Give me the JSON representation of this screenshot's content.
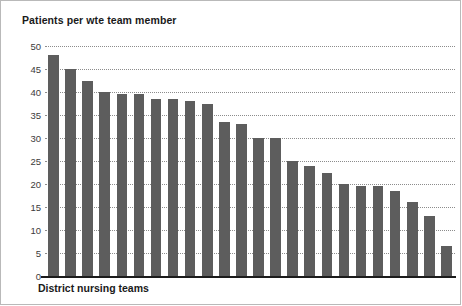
{
  "chart_data": {
    "type": "bar",
    "title": "Patients per wte team member",
    "xlabel": "District nursing teams",
    "ylabel": "",
    "ylim": [
      0,
      50
    ],
    "ytick_step": 5,
    "yticks": [
      50,
      45,
      40,
      35,
      30,
      25,
      20,
      15,
      10,
      5,
      0
    ],
    "grid": true,
    "grid_style": "dotted-horizontal",
    "legend": "none",
    "bar_color": "#5d5d5d",
    "categories": [
      "Team 1",
      "Team 2",
      "Team 3",
      "Team 4",
      "Team 5",
      "Team 6",
      "Team 7",
      "Team 8",
      "Team 9",
      "Team 10",
      "Team 11",
      "Team 12",
      "Team 13",
      "Team 14",
      "Team 15",
      "Team 16",
      "Team 17",
      "Team 18",
      "Team 19",
      "Team 20",
      "Team 21",
      "Team 22",
      "Team 23",
      "Team 24"
    ],
    "values": [
      48,
      45,
      42.5,
      40,
      39.5,
      39.5,
      38.5,
      38.5,
      38,
      37.5,
      33.5,
      33,
      30,
      30,
      25,
      24,
      22.5,
      20,
      19.5,
      19.5,
      18.5,
      16,
      13,
      6.5
    ]
  }
}
